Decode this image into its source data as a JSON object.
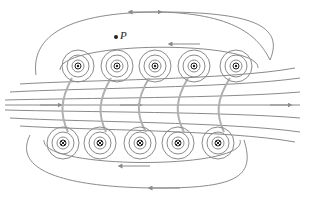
{
  "figure": {
    "point_label": "P",
    "colors": {
      "field_line": "#8a8a8a",
      "wire": "#222222",
      "background": "#ffffff"
    },
    "top_row_wires": {
      "direction": "out-of-page",
      "symbol": "dot",
      "x": [
        78,
        117,
        155,
        194,
        236
      ],
      "y": 66
    },
    "bottom_row_wires": {
      "direction": "into-page",
      "symbol": "cross",
      "x": [
        63,
        100,
        140,
        178,
        218
      ],
      "y": 143
    }
  }
}
